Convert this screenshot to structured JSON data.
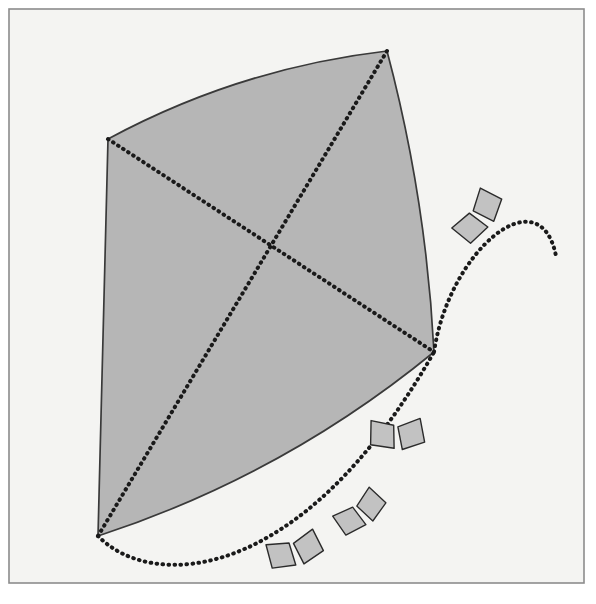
{
  "page": {
    "width": 596,
    "height": 604,
    "background_color": "#ffffff"
  },
  "frame": {
    "name": "page-border",
    "x": 9,
    "y": 9,
    "width": 575,
    "height": 574,
    "stroke_color": "#8c8c8c",
    "stroke_width": 1.6,
    "fill_color": "#f4f4f2"
  },
  "kite": {
    "name": "kite-body",
    "fill_color": "#b6b6b6",
    "stroke_color": "#3a3a3a",
    "stroke_width": 1.7,
    "vertices": {
      "top": {
        "x": 387,
        "y": 51
      },
      "left": {
        "x": 108,
        "y": 139
      },
      "bottom": {
        "x": 98,
        "y": 536
      },
      "right": {
        "x": 434,
        "y": 352
      }
    },
    "edge_curvature": {
      "top_left_bulge": 14,
      "top_right_bulge": 8,
      "bottom_right_bulge": 18,
      "bottom_left_bulge": 6
    },
    "spars": {
      "color": "#1a1a1a",
      "dot_radius": 2.0,
      "dash_pattern": "0.6 5.4",
      "crossing_point": {
        "x": 268,
        "y": 253
      },
      "long_spar": "top-to-bottom",
      "short_spar": "left-to-right"
    }
  },
  "tail": {
    "name": "kite-tail",
    "color": "#1a1a1a",
    "dot_radius": 2.0,
    "dash_pattern": "0.6 5.4",
    "lower_segment": {
      "start": {
        "x": 98,
        "y": 536
      },
      "control_1": {
        "x": 150,
        "y": 590
      },
      "control_2": {
        "x": 300,
        "y": 588
      },
      "end": {
        "x": 434,
        "y": 352
      }
    },
    "upper_segment": {
      "start": {
        "x": 434,
        "y": 352
      },
      "control_1": {
        "x": 449,
        "y": 250
      },
      "control_2": {
        "x": 540,
        "y": 175
      },
      "end": {
        "x": 556,
        "y": 256
      }
    }
  },
  "bows": {
    "name": "tail-bows",
    "count": 4,
    "fill_color": "#c2c2c2",
    "stroke_color": "#2b2b2b",
    "stroke_width": 1.4,
    "items": [
      {
        "label": "bow-1",
        "x": 292,
        "y": 545,
        "rotation": -22,
        "scale": 1.0
      },
      {
        "label": "bow-2",
        "x": 356,
        "y": 508,
        "rotation": -42,
        "scale": 0.95
      },
      {
        "label": "bow-3",
        "x": 396,
        "y": 428,
        "rotation": -6,
        "scale": 1.0
      },
      {
        "label": "bow-4",
        "x": 473,
        "y": 213,
        "rotation": -58,
        "scale": 1.0
      }
    ]
  },
  "chart_data": {
    "type": "scatter"
  }
}
